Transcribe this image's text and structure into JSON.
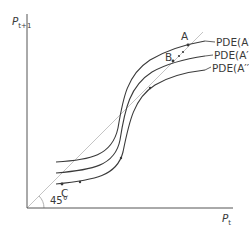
{
  "diagram": {
    "axes": {
      "y_label_main": "P",
      "y_label_sub": "t+1",
      "x_label_main": "P",
      "x_label_sub": "t"
    },
    "reference_line": {
      "label": "45°",
      "color": "#bdbdbd"
    },
    "curves": [
      {
        "name": "pde-a",
        "label": "PDE(A)"
      },
      {
        "name": "pde-a-prime",
        "label": "PDE(A′)"
      },
      {
        "name": "pde-a-double-prime",
        "label": "PDE(A′′)"
      }
    ],
    "points": [
      {
        "name": "point-a",
        "label": "A"
      },
      {
        "name": "point-b",
        "label": "B"
      },
      {
        "name": "point-c",
        "label": "C"
      }
    ],
    "colors": {
      "curve": "#3a3a3a",
      "axis": "#555555",
      "diagonal": "#c4c4c4"
    }
  }
}
